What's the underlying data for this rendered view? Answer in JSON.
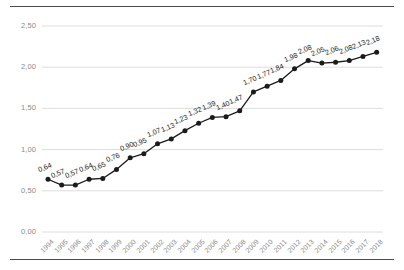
{
  "chart_data": {
    "type": "line",
    "title": "",
    "subtitle": "",
    "xlabel": "",
    "ylabel": "",
    "ylim": [
      0.0,
      2.5
    ],
    "yticks": [
      "0,00",
      "0,50",
      "1,00",
      "1,50",
      "2,00",
      "2,50"
    ],
    "ytick_values": [
      0.0,
      0.5,
      1.0,
      1.5,
      2.0,
      2.5
    ],
    "grid": "horizontal",
    "legend": "none",
    "marker": "filled-circle",
    "line_color": "#1b1b1b",
    "marker_color": "#1b1b1b",
    "grid_color": "#d9d9d9",
    "label_color": "#8a8a8a",
    "categories": [
      "1994",
      "1995",
      "1996",
      "1997",
      "1998",
      "1999",
      "2000",
      "2001",
      "2002",
      "2003",
      "2004",
      "2005",
      "2006",
      "2007",
      "2008",
      "2009",
      "2010",
      "2011",
      "2012",
      "2013",
      "2014",
      "2015",
      "2016",
      "2017",
      "2018"
    ],
    "values": [
      0.64,
      0.57,
      0.57,
      0.64,
      0.65,
      0.76,
      0.9,
      0.95,
      1.07,
      1.13,
      1.23,
      1.32,
      1.39,
      1.4,
      1.47,
      1.7,
      1.77,
      1.84,
      1.98,
      2.08,
      2.05,
      2.06,
      2.08,
      2.13,
      2.18
    ],
    "data_labels": [
      "0,64",
      "0,57",
      "0,57",
      "0,64",
      "0,65",
      "0,76",
      "0,90",
      "0,95",
      "1,07",
      "1,13",
      "1,23",
      "1,32",
      "1,39",
      "1,40",
      "1,47",
      "1,70",
      "1,77",
      "1,84",
      "1,98",
      "2,08",
      "2,05",
      "2,06",
      "2,08",
      "2,13",
      "2,18"
    ]
  }
}
